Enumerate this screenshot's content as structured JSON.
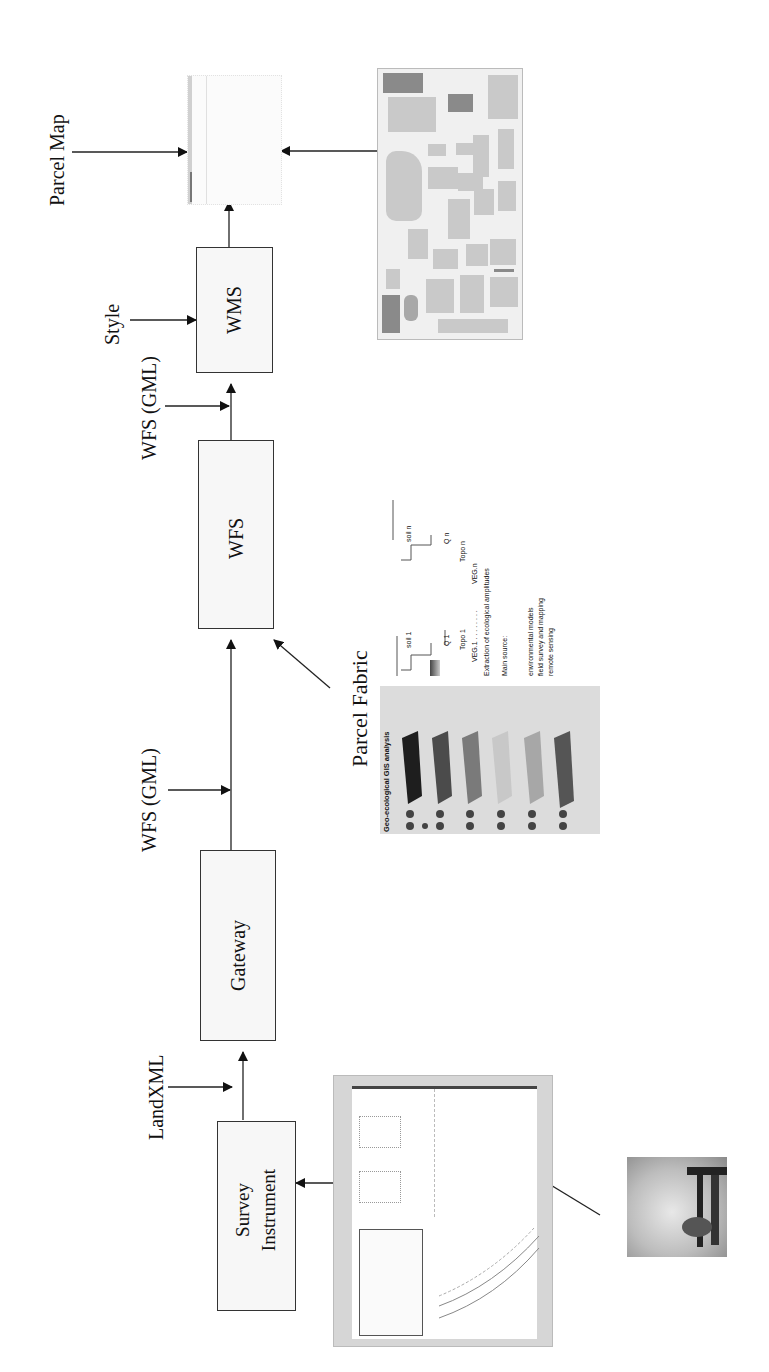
{
  "diagram": {
    "orientation": "rotated-90-ccw",
    "nodes": {
      "survey_instrument": {
        "line1": "Survey",
        "line2": "Instrument"
      },
      "gateway": {
        "label": "Gateway"
      },
      "wfs": {
        "label": "WFS"
      },
      "wms": {
        "label": "WMS"
      }
    },
    "edge_labels": {
      "landxml": "LandXML",
      "wfs_gml_lower": "WFS (GML)",
      "wfs_gml_upper": "WFS (GML)",
      "style": "Style",
      "parcel_map": "Parcel Map",
      "parcel_fabric": "Parcel Fabric"
    },
    "images": {
      "survey_drawing": "survey-plan-drawing",
      "field_photo": "survey-field-photo",
      "gis_layers": "geo-ecological-gis-layers",
      "city_map": "city-street-map",
      "parcel_map_output": "parcel-map-output"
    },
    "gis_figure": {
      "title": "Geo-ecological GIS analysis",
      "layers": [
        "soil moisture, temp.",
        "precipitation, fog",
        "temperature, wind",
        "solar radiation",
        "relief",
        "vegetation"
      ],
      "detail": {
        "soil_1": "soil 1",
        "soil_n": "soil n",
        "q1": "Q 1",
        "qn": "Q n",
        "topo1": "Topo 1",
        "topon": "Topo n",
        "veg1": "VEG.1 . . . . . . . .",
        "vegn": "VEG.n",
        "extraction": "Extraction of ecological amplitudes",
        "main_source": "Main source:",
        "sources": [
          "environmental models",
          "field survey and mapping",
          "remote sensing"
        ]
      }
    },
    "city_map_labels": [
      "Avenida dei Mezzocanale",
      "Calle",
      "Ponte",
      "Canale",
      "Calle Bona",
      "Calle",
      "Fondamenta",
      "Calle Larga"
    ]
  }
}
